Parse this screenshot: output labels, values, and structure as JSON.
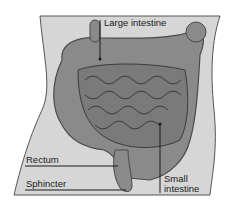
{
  "diagram": {
    "labels": {
      "large_intestine": "Large intestine",
      "rectum": "Rectum",
      "sphincter": "Sphincter",
      "small_intestine_line1": "Small",
      "small_intestine_line2": "intestine"
    },
    "colors": {
      "background": "#ffffff",
      "body_fill": "#d6d6d6",
      "organ_fill": "#8a8a8a",
      "organ_dark": "#4a4a4a",
      "line": "#1a1a1a"
    }
  }
}
